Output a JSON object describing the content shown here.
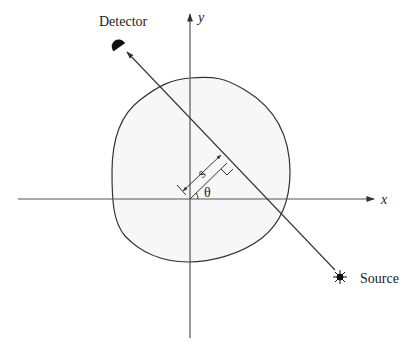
{
  "diagram": {
    "type": "tomography-projection-geometry",
    "axes": {
      "x_label": "x",
      "y_label": "y",
      "origin": [
        190,
        199
      ]
    },
    "labels": {
      "detector": "Detector",
      "source": "Source",
      "distance": "s",
      "angle": "θ"
    },
    "colors": {
      "line": "#333333",
      "object_fill": "#f7f7f7",
      "axis": "#555555"
    }
  }
}
